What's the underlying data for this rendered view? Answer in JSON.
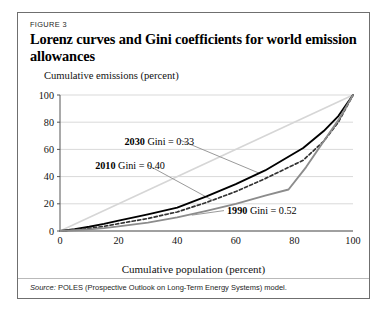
{
  "figure": {
    "number_label": "FIGURE 3",
    "title": "Lorenz curves and Gini coefficients for world emission allowances",
    "source_lead": "Source:",
    "source_text": "POLES (Prospective Outlook on Long-Term Energy Systems) model."
  },
  "chart_data": {
    "type": "line",
    "title": "Lorenz curves and Gini coefficients for world emission allowances",
    "xlabel": "Cumulative population (percent)",
    "ylabel": "Cumulative emissions (percent)",
    "xlim": [
      0,
      100
    ],
    "ylim": [
      0,
      100
    ],
    "xticks": [
      0,
      20,
      40,
      60,
      80,
      100
    ],
    "yticks": [
      0,
      20,
      40,
      60,
      80,
      100
    ],
    "grid": "horizontal",
    "legend": "inline-annotations",
    "series": [
      {
        "name": "2030",
        "gini": 0.33,
        "annotation": "2030 Gini = 0.33",
        "color": "#000000",
        "style": "solid",
        "width": 1.9,
        "x": [
          0,
          5,
          10,
          15,
          20,
          30,
          40,
          50,
          60,
          70,
          83,
          90,
          95,
          100
        ],
        "y": [
          0,
          1.4,
          3.1,
          5.2,
          7.6,
          12.2,
          17.2,
          25.5,
          34.5,
          44.5,
          61.0,
          73.5,
          84.5,
          100
        ]
      },
      {
        "name": "2010",
        "gini": 0.4,
        "annotation": "2010 Gini = 0.40",
        "color": "#333333",
        "style": "dashed",
        "width": 1.7,
        "x": [
          0,
          5,
          10,
          15,
          20,
          30,
          40,
          50,
          60,
          70,
          83,
          90,
          95,
          100
        ],
        "y": [
          0,
          0.9,
          2.0,
          3.4,
          5.4,
          9.2,
          14.0,
          21.0,
          29.0,
          38.5,
          52.0,
          66.0,
          80.0,
          100
        ]
      },
      {
        "name": "1990",
        "gini": 0.52,
        "annotation": "1990 Gini = 0.52",
        "color": "#8c8c8c",
        "style": "solid",
        "width": 1.9,
        "x": [
          0,
          5,
          10,
          15,
          20,
          30,
          40,
          50,
          60,
          70,
          78,
          84,
          90,
          95,
          100
        ],
        "y": [
          0,
          0.5,
          1.2,
          2.1,
          3.4,
          6.2,
          10.0,
          14.8,
          20.0,
          26.0,
          30.5,
          47.0,
          66.0,
          81.5,
          100
        ]
      }
    ],
    "equality_line": {
      "name": "line of equality",
      "color": "#d6d6d6",
      "x": [
        0,
        100
      ],
      "y": [
        0,
        100
      ]
    },
    "annotations": [
      {
        "id": "ann-2030",
        "year": "2030",
        "rest": " Gini = 0.33",
        "x": 22,
        "y": 66
      },
      {
        "id": "ann-2010",
        "year": "2010",
        "rest": " Gini = 0.40",
        "x": 12,
        "y": 48
      },
      {
        "id": "ann-1990",
        "year": "1990",
        "rest": " Gini = 0.52",
        "x": 57,
        "y": 15
      }
    ]
  },
  "colors": {
    "frame": "#6f6f6f",
    "grid": "#d9d9d9",
    "axis": "#555555",
    "text": "#111111",
    "leader": "#9a9a9a"
  }
}
